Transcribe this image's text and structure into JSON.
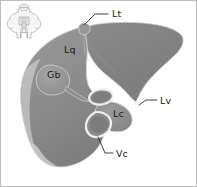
{
  "figure": {
    "modality": "grayscale anatomical line drawing",
    "background_color": "#ffffff",
    "frame_color": "#bdbdbd",
    "organ_fill_color": "#8d8d8d",
    "organ_fill_light_color": "#9d9d9d",
    "organ_shadow_color": "#787878",
    "organ_outline_color": "#d6d6d6",
    "vessel_ring_color": "#ededed",
    "label_color": "#1a1a1a",
    "leader_color": "#2b2b2b"
  },
  "inset": {
    "name": "orientation-inset",
    "description": "small pale outline of a body/torso plan shown top-left as an orientation key",
    "stroke_color": "#9a9a9a",
    "fill_color": "#f2f2f2"
  },
  "labels": [
    {
      "id": "lt",
      "text": "Lt",
      "meaning": "lobus sinister (left lobe) / triangular ligament apex",
      "x": 112,
      "y": 16,
      "has_leader": true,
      "leader": "M 108 14 L 95 14 L 84 25"
    },
    {
      "id": "lq",
      "text": "Lq",
      "meaning": "lobus quadratus",
      "x": 64,
      "y": 52,
      "has_leader": false,
      "leader": ""
    },
    {
      "id": "gb",
      "text": "Gb",
      "meaning": "gallbladder (vesica fellea)",
      "x": 47,
      "y": 77,
      "has_leader": false,
      "leader": ""
    },
    {
      "id": "lv",
      "text": "Lv",
      "meaning": "lobus ventralis / ventral lobe margin",
      "x": 160,
      "y": 103,
      "has_leader": true,
      "leader": "M 157 100 L 146 100 L 139 105"
    },
    {
      "id": "lc",
      "text": "Lc",
      "meaning": "lobus caudatus",
      "x": 113,
      "y": 116,
      "has_leader": false,
      "leader": ""
    },
    {
      "id": "vc",
      "text": "Vc",
      "meaning": "vena cava caudalis",
      "x": 116,
      "y": 156,
      "has_leader": true,
      "leader": "M 113 153 L 105 153 L 98 137"
    }
  ],
  "structures": [
    {
      "id": "liver-body",
      "name": "liver-main-mass"
    },
    {
      "id": "liver-right-lobe",
      "name": "right-lobe-wing"
    },
    {
      "id": "gallbladder",
      "name": "gallbladder-bulge"
    },
    {
      "id": "caudate-lobe",
      "name": "caudate-lobe"
    },
    {
      "id": "portal-vessel-ring",
      "name": "portal-vein-opening"
    },
    {
      "id": "cava-vessel-ring",
      "name": "caudal-vena-cava-opening"
    },
    {
      "id": "apex-notch",
      "name": "apex-notch-bump"
    }
  ]
}
